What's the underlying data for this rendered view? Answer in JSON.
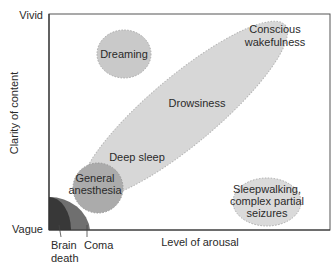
{
  "title_fragment": "Arousal and clarity",
  "axes": {
    "y_label": "Clarity of content",
    "y_top": "Vivid",
    "y_bottom": "Vague",
    "x_label": "Level of arousal"
  },
  "regions": {
    "dreaming": "Dreaming",
    "conscious_1": "Conscious",
    "conscious_2": "wakefulness",
    "drowsiness": "Drowsiness",
    "deep_sleep": "Deep sleep",
    "anesthesia_1": "General",
    "anesthesia_2": "anesthesia",
    "sleepwalking_1": "Sleepwalking,",
    "sleepwalking_2": "complex partial",
    "sleepwalking_3": "seizures",
    "brain_death_1": "Brain",
    "brain_death_2": "death",
    "coma": "Coma"
  },
  "colors": {
    "frame": "#555555",
    "ellipse_light": "#d9d9d9",
    "ellipse_mid": "#bdbdbd",
    "anesthesia": "#a9a9a9",
    "coma": "#6d6d6d",
    "brain_death": "#3a3a3a"
  }
}
